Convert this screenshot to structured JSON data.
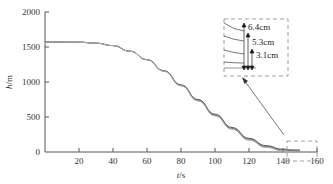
{
  "chart_data": {
    "type": "line",
    "title": "",
    "xlabel": "t/s",
    "ylabel": "h/m",
    "xlim": [
      0,
      160
    ],
    "ylim": [
      0,
      2000
    ],
    "xticks": [
      20,
      40,
      60,
      80,
      100,
      120,
      140,
      160
    ],
    "yticks": [
      0,
      500,
      1000,
      1500,
      2000
    ],
    "grid": false,
    "series": [
      {
        "name": "curve-1",
        "x": [
          0,
          10,
          20,
          30,
          40,
          50,
          60,
          70,
          80,
          90,
          100,
          110,
          120,
          130,
          140,
          145,
          150
        ],
        "values": [
          1570,
          1570,
          1568,
          1555,
          1520,
          1440,
          1320,
          1160,
          960,
          750,
          540,
          350,
          195,
          90,
          40,
          30,
          28
        ]
      },
      {
        "name": "curve-2",
        "x": [
          0,
          10,
          20,
          30,
          40,
          50,
          60,
          70,
          80,
          90,
          100,
          110,
          120,
          130,
          140,
          145,
          150
        ],
        "values": [
          1570,
          1570,
          1568,
          1555,
          1520,
          1440,
          1320,
          1160,
          955,
          742,
          530,
          340,
          185,
          80,
          30,
          20,
          18
        ]
      },
      {
        "name": "curve-3",
        "x": [
          0,
          10,
          20,
          30,
          40,
          50,
          60,
          70,
          80,
          90,
          100,
          110,
          120,
          130,
          140,
          145,
          150
        ],
        "values": [
          1570,
          1570,
          1568,
          1555,
          1520,
          1440,
          1318,
          1156,
          950,
          735,
          522,
          332,
          176,
          72,
          22,
          12,
          10
        ]
      },
      {
        "name": "curve-4",
        "x": [
          0,
          10,
          20,
          30,
          40,
          50,
          60,
          70,
          80,
          90,
          100,
          110,
          120,
          130,
          140,
          145,
          150
        ],
        "values": [
          1570,
          1570,
          1568,
          1555,
          1520,
          1440,
          1316,
          1152,
          945,
          728,
          514,
          324,
          168,
          64,
          14,
          4,
          2
        ]
      }
    ],
    "annotations": [
      {
        "type": "zoom-box",
        "region": "t=140-160, h≈0-100"
      },
      {
        "type": "inset",
        "labels": [
          "6.4cm",
          "5.3cm",
          "3.1cm"
        ]
      },
      {
        "type": "arrow",
        "from": "zoom-box",
        "to": "inset"
      }
    ]
  },
  "axes": {
    "x_label_italic": "t",
    "x_label_unit": "/s",
    "y_label_italic": "h",
    "y_label_unit": "/m",
    "x_tick_labels": [
      "20",
      "40",
      "60",
      "80",
      "100",
      "120",
      "140",
      "160"
    ],
    "y_tick_labels": [
      "0",
      "500",
      "1000",
      "1500",
      "2000"
    ]
  },
  "inset": {
    "labels": [
      "6.4cm",
      "5.3cm",
      "3.1cm"
    ]
  },
  "colors": {
    "axis": "#555555",
    "curve": "#666666",
    "dash": "#888888"
  }
}
